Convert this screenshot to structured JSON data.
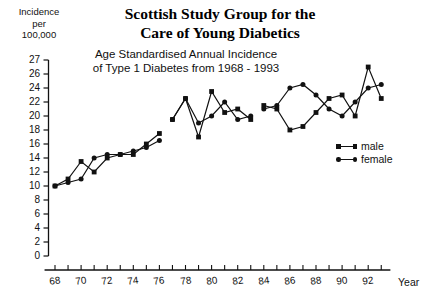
{
  "titles": {
    "main_line1": "Scottish Study Group for the",
    "main_line2": "Care of Young Diabetics",
    "sub_line1": "Age Standardised Annual Incidence",
    "sub_line2": "of Type  1 Diabetes from 1968 - 1993"
  },
  "axis": {
    "y_caption_line1": "Incidence",
    "y_caption_line2": "per",
    "y_caption_line3": "100,000",
    "x_title": "Year"
  },
  "legend": {
    "items": [
      {
        "label": "male",
        "marker": "square",
        "color": "#111111"
      },
      {
        "label": "female",
        "marker": "circle",
        "color": "#111111"
      }
    ]
  },
  "chart_data": {
    "type": "line",
    "title": "Scottish Study Group for the Care of Young Diabetics",
    "subtitle": "Age Standardised Annual Incidence of Type 1 Diabetes from 1968 - 1993",
    "xlabel": "Year",
    "ylabel": "Incidence per 100,000",
    "grid": false,
    "legend_position": "right",
    "xlim": [
      67.2,
      93.6
    ],
    "ylim": [
      0,
      27
    ],
    "ytick_values": [
      0,
      2,
      4,
      6,
      8,
      10,
      12,
      14,
      16,
      18,
      20,
      22,
      24,
      26,
      27
    ],
    "ytick_labels": [
      "0",
      "2",
      "4",
      "6",
      "8",
      "10",
      "12",
      "14",
      "16",
      "18",
      "20",
      "22",
      "24",
      "26",
      "27"
    ],
    "xtick_values": [
      68,
      69,
      70,
      71,
      72,
      73,
      74,
      75,
      76,
      77,
      78,
      79,
      80,
      81,
      82,
      83,
      84,
      85,
      86,
      87,
      88,
      89,
      90,
      91,
      92,
      93
    ],
    "xtick_labels_shown": [
      "68",
      "70",
      "72",
      "74",
      "76",
      "78",
      "80",
      "82",
      "84",
      "86",
      "88",
      "90",
      "92"
    ],
    "series": [
      {
        "name": "male",
        "marker": "square",
        "color": "#111111",
        "segments": [
          {
            "x": [
              68,
              69,
              70,
              71,
              72,
              73,
              74,
              75,
              76
            ],
            "y": [
              10.0,
              11.0,
              13.5,
              12.0,
              14.0,
              14.5,
              14.5,
              16.0,
              17.5
            ]
          },
          {
            "x": [
              77,
              78,
              79,
              80,
              81,
              82,
              83
            ],
            "y": [
              19.5,
              22.5,
              17.0,
              23.5,
              20.5,
              21.0,
              19.5
            ]
          },
          {
            "x": [
              84,
              85,
              86,
              87,
              88,
              89,
              90,
              91,
              92,
              93
            ],
            "y": [
              21.5,
              21.0,
              18.0,
              18.5,
              20.5,
              22.5,
              23.0,
              20.0,
              26.5,
              22.5
            ]
          }
        ]
      },
      {
        "name": "female",
        "marker": "circle",
        "color": "#111111",
        "segments": [
          {
            "x": [
              68,
              69,
              70,
              71,
              72,
              73,
              74,
              75,
              76
            ],
            "y": [
              10.0,
              10.5,
              11.0,
              14.0,
              14.5,
              14.5,
              15.0,
              15.5,
              16.5
            ]
          },
          {
            "x": [
              77,
              78,
              79,
              80,
              81,
              82,
              83
            ],
            "y": [
              19.5,
              22.5,
              19.0,
              20.0,
              22.0,
              19.5,
              20.0
            ]
          },
          {
            "x": [
              84,
              85,
              86,
              87,
              88,
              89,
              90,
              91,
              92,
              93
            ],
            "y": [
              21.0,
              21.5,
              24.0,
              24.5,
              23.0,
              21.0,
              20.0,
              22.0,
              24.0,
              24.5
            ]
          }
        ]
      }
    ]
  }
}
